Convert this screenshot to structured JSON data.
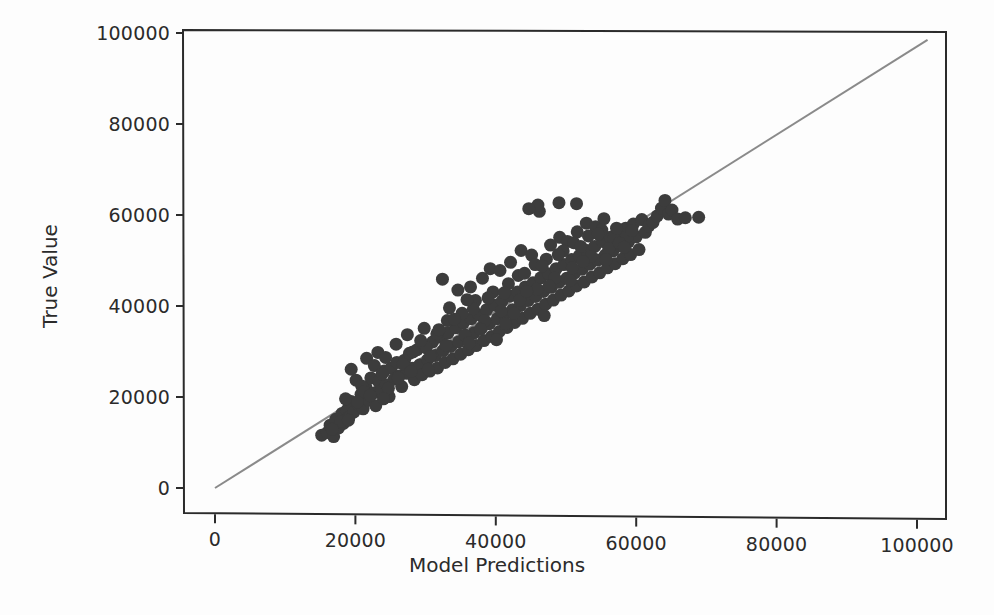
{
  "chart_data": {
    "type": "scatter",
    "title": "",
    "xlabel": "Model Predictions",
    "ylabel": "True Value",
    "xlim": [
      -8000,
      110000
    ],
    "ylim": [
      -8000,
      107000
    ],
    "xticks": [
      0,
      20000,
      40000,
      60000,
      80000,
      100000
    ],
    "yticks": [
      0,
      20000,
      40000,
      60000,
      80000,
      100000
    ],
    "xtick_labels": [
      "0",
      "20000",
      "40000",
      "60000",
      "80000",
      "100000"
    ],
    "ytick_labels": [
      "0",
      "20000",
      "40000",
      "60000",
      "80000",
      "100000"
    ],
    "grid": false,
    "legend": null,
    "marker_color": "#3c3c3c",
    "marker_size": 13,
    "reference_line": {
      "name": "identity-line",
      "color": "#8a8a8a",
      "width": 2,
      "x": [
        0,
        101500
      ],
      "y": [
        0,
        98500
      ]
    },
    "series": [
      {
        "name": "predictions-vs-true",
        "points": [
          [
            15200,
            11600
          ],
          [
            16000,
            12200
          ],
          [
            16400,
            13800
          ],
          [
            16900,
            11300
          ],
          [
            17200,
            15100
          ],
          [
            17600,
            13200
          ],
          [
            18100,
            16400
          ],
          [
            18300,
            14200
          ],
          [
            18800,
            17100
          ],
          [
            19100,
            15600
          ],
          [
            19400,
            19000
          ],
          [
            19800,
            16700
          ],
          [
            20100,
            23700
          ],
          [
            20500,
            18200
          ],
          [
            20800,
            20600
          ],
          [
            21100,
            17400
          ],
          [
            21500,
            22100
          ],
          [
            21900,
            19300
          ],
          [
            22200,
            24200
          ],
          [
            22600,
            20900
          ],
          [
            22900,
            18100
          ],
          [
            23300,
            23400
          ],
          [
            23700,
            21400
          ],
          [
            24100,
            25700
          ],
          [
            24400,
            22600
          ],
          [
            24800,
            20100
          ],
          [
            25100,
            26400
          ],
          [
            25500,
            23900
          ],
          [
            25900,
            27600
          ],
          [
            26200,
            24600
          ],
          [
            26600,
            22300
          ],
          [
            27000,
            28100
          ],
          [
            27300,
            25200
          ],
          [
            27700,
            29600
          ],
          [
            28100,
            26300
          ],
          [
            28400,
            23800
          ],
          [
            28800,
            30400
          ],
          [
            29200,
            27100
          ],
          [
            29500,
            24900
          ],
          [
            29900,
            31200
          ],
          [
            30300,
            28200
          ],
          [
            30600,
            25700
          ],
          [
            31000,
            32100
          ],
          [
            31400,
            29100
          ],
          [
            31700,
            26400
          ],
          [
            32100,
            33200
          ],
          [
            32500,
            30200
          ],
          [
            32800,
            27600
          ],
          [
            33200,
            34100
          ],
          [
            33600,
            31100
          ],
          [
            33900,
            28400
          ],
          [
            34300,
            35200
          ],
          [
            34700,
            32100
          ],
          [
            35000,
            29400
          ],
          [
            35400,
            36300
          ],
          [
            35800,
            33200
          ],
          [
            36100,
            30400
          ],
          [
            36500,
            37200
          ],
          [
            36900,
            34100
          ],
          [
            37200,
            31300
          ],
          [
            37600,
            38100
          ],
          [
            38000,
            35200
          ],
          [
            38300,
            32400
          ],
          [
            38700,
            39200
          ],
          [
            39100,
            36100
          ],
          [
            39400,
            33300
          ],
          [
            39800,
            40200
          ],
          [
            40200,
            37200
          ],
          [
            40500,
            34400
          ],
          [
            40900,
            41100
          ],
          [
            41300,
            38100
          ],
          [
            41600,
            35300
          ],
          [
            42000,
            42200
          ],
          [
            42400,
            39200
          ],
          [
            42700,
            36400
          ],
          [
            43100,
            43100
          ],
          [
            43500,
            40100
          ],
          [
            43800,
            37300
          ],
          [
            44200,
            44200
          ],
          [
            44600,
            41200
          ],
          [
            44900,
            38400
          ],
          [
            45300,
            45100
          ],
          [
            45700,
            42100
          ],
          [
            46000,
            39300
          ],
          [
            46400,
            46200
          ],
          [
            46800,
            43200
          ],
          [
            47100,
            40400
          ],
          [
            47500,
            47100
          ],
          [
            47900,
            44100
          ],
          [
            48200,
            41300
          ],
          [
            48600,
            48200
          ],
          [
            49000,
            45200
          ],
          [
            49300,
            42400
          ],
          [
            49700,
            49100
          ],
          [
            50100,
            46100
          ],
          [
            50400,
            43300
          ],
          [
            50800,
            50200
          ],
          [
            51200,
            47200
          ],
          [
            51500,
            44400
          ],
          [
            51900,
            51100
          ],
          [
            52300,
            48100
          ],
          [
            52600,
            45300
          ],
          [
            53000,
            52200
          ],
          [
            53400,
            49200
          ],
          [
            53700,
            46400
          ],
          [
            54100,
            53100
          ],
          [
            54500,
            50100
          ],
          [
            54800,
            47300
          ],
          [
            55200,
            54200
          ],
          [
            55600,
            51200
          ],
          [
            55900,
            48400
          ],
          [
            56300,
            55100
          ],
          [
            56700,
            52100
          ],
          [
            57000,
            49300
          ],
          [
            57400,
            56000
          ],
          [
            57800,
            53200
          ],
          [
            58100,
            50400
          ],
          [
            58500,
            57100
          ],
          [
            58900,
            54100
          ],
          [
            59200,
            51300
          ],
          [
            59600,
            58000
          ],
          [
            60000,
            55200
          ],
          [
            60400,
            52400
          ],
          [
            60800,
            59000
          ],
          [
            61300,
            56200
          ],
          [
            61800,
            57600
          ],
          [
            62400,
            58400
          ],
          [
            63000,
            59800
          ],
          [
            63600,
            61500
          ],
          [
            64100,
            63200
          ],
          [
            64600,
            60200
          ],
          [
            65100,
            61100
          ],
          [
            65900,
            59100
          ],
          [
            67000,
            59400
          ],
          [
            68900,
            59500
          ],
          [
            21600,
            28500
          ],
          [
            23200,
            29800
          ],
          [
            25800,
            31600
          ],
          [
            27400,
            33700
          ],
          [
            29800,
            35100
          ],
          [
            31600,
            33900
          ],
          [
            32400,
            45900
          ],
          [
            34600,
            43500
          ],
          [
            36400,
            44200
          ],
          [
            38100,
            46100
          ],
          [
            39200,
            48200
          ],
          [
            40600,
            47800
          ],
          [
            42100,
            49600
          ],
          [
            43600,
            52200
          ],
          [
            45100,
            51200
          ],
          [
            46200,
            60800
          ],
          [
            47800,
            53400
          ],
          [
            49100,
            55100
          ],
          [
            50200,
            54200
          ],
          [
            51600,
            56300
          ],
          [
            52900,
            58200
          ],
          [
            54200,
            57400
          ],
          [
            55400,
            59200
          ],
          [
            46000,
            62200
          ],
          [
            49000,
            62700
          ],
          [
            51500,
            62500
          ],
          [
            44700,
            61400
          ],
          [
            19400,
            26100
          ],
          [
            20900,
            22400
          ],
          [
            22700,
            26900
          ],
          [
            24300,
            28700
          ],
          [
            26100,
            24200
          ],
          [
            28200,
            29900
          ],
          [
            30100,
            30800
          ],
          [
            33100,
            36800
          ],
          [
            35200,
            38400
          ],
          [
            37100,
            41200
          ],
          [
            39600,
            43100
          ],
          [
            41800,
            44900
          ],
          [
            43200,
            46700
          ],
          [
            45600,
            49100
          ],
          [
            47200,
            50300
          ],
          [
            49600,
            52100
          ],
          [
            51100,
            53900
          ],
          [
            53200,
            55400
          ],
          [
            55100,
            56700
          ],
          [
            56800,
            54900
          ],
          [
            18600,
            19600
          ],
          [
            21200,
            21100
          ],
          [
            23800,
            25100
          ],
          [
            26800,
            27200
          ],
          [
            29300,
            32400
          ],
          [
            31900,
            34800
          ],
          [
            34100,
            37100
          ],
          [
            36800,
            39400
          ],
          [
            38900,
            41800
          ],
          [
            41200,
            42900
          ],
          [
            44100,
            47200
          ],
          [
            46600,
            48800
          ],
          [
            48900,
            51300
          ],
          [
            52100,
            53100
          ],
          [
            54600,
            55800
          ],
          [
            57200,
            57100
          ],
          [
            17900,
            14600
          ],
          [
            20300,
            18900
          ],
          [
            22100,
            20300
          ],
          [
            24700,
            21900
          ],
          [
            27900,
            25600
          ],
          [
            30700,
            28900
          ],
          [
            32900,
            31400
          ],
          [
            35600,
            33600
          ],
          [
            38400,
            36800
          ],
          [
            40800,
            38900
          ],
          [
            43400,
            41300
          ],
          [
            45900,
            43700
          ],
          [
            48400,
            46200
          ],
          [
            50900,
            48400
          ],
          [
            53600,
            50900
          ],
          [
            56100,
            52600
          ],
          [
            58700,
            55300
          ],
          [
            16700,
            12900
          ],
          [
            19000,
            14900
          ],
          [
            24000,
            19600
          ],
          [
            30400,
            26100
          ],
          [
            36200,
            31900
          ],
          [
            42600,
            38400
          ],
          [
            47600,
            44400
          ],
          [
            52400,
            49800
          ],
          [
            57600,
            53800
          ],
          [
            59400,
            56600
          ],
          [
            41400,
            36100
          ],
          [
            33400,
            39600
          ],
          [
            35900,
            41400
          ],
          [
            37800,
            34900
          ],
          [
            44400,
            43200
          ],
          [
            50600,
            45600
          ],
          [
            55700,
            50200
          ],
          [
            58300,
            52900
          ],
          [
            40100,
            32600
          ],
          [
            46900,
            37900
          ]
        ]
      }
    ]
  },
  "axes": {
    "x_label": "Model Predictions",
    "y_label": "True Value"
  }
}
